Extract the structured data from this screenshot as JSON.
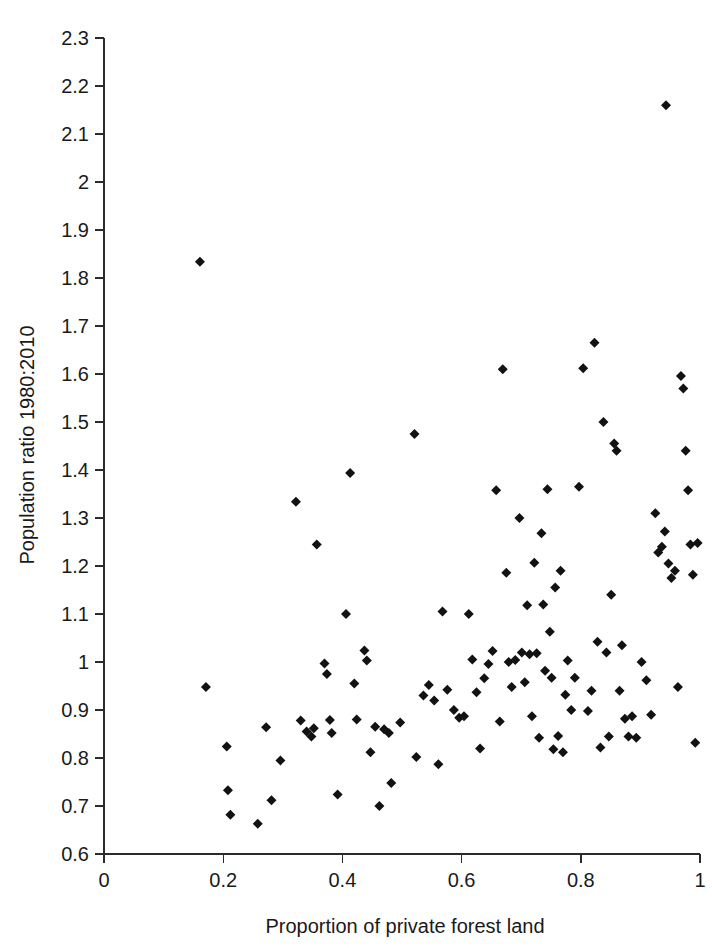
{
  "figure": {
    "background_color": "#ffffff",
    "marker_color": "#121212",
    "axis_color": "#2b2b2b",
    "marker_shape": "diamond"
  },
  "chart_data": {
    "type": "scatter",
    "title": "",
    "subtitle": "",
    "xlabel": "Proportion of private forest land",
    "ylabel": "Population ratio 1980:2010",
    "xlim": [
      0,
      1
    ],
    "ylim": [
      0.6,
      2.3
    ],
    "grid": false,
    "legend": null,
    "xticks": [
      0,
      0.2,
      0.4,
      0.6,
      0.8,
      1
    ],
    "xtick_labels": [
      "0",
      "0.2",
      "0.4",
      "0.6",
      "0.8",
      "1"
    ],
    "yticks": [
      0.6,
      0.7,
      0.8,
      0.9,
      1.0,
      1.1,
      1.2,
      1.3,
      1.4,
      1.5,
      1.6,
      1.7,
      1.8,
      1.9,
      2.0,
      2.1,
      2.2,
      2.3
    ],
    "ytick_labels": [
      "0.6",
      "0.7",
      "0.8",
      "0.9",
      "1",
      "1.1",
      "1.2",
      "1.3",
      "1.4",
      "1.5",
      "1.6",
      "1.7",
      "1.8",
      "1.9",
      "2",
      "2.1",
      "2.2",
      "2.3"
    ],
    "n_points": 121,
    "points": [
      [
        0.161,
        1.834
      ],
      [
        0.943,
        2.16
      ],
      [
        0.171,
        0.948
      ],
      [
        0.206,
        0.824
      ],
      [
        0.208,
        0.733
      ],
      [
        0.212,
        0.682
      ],
      [
        0.258,
        0.663
      ],
      [
        0.272,
        0.864
      ],
      [
        0.281,
        0.712
      ],
      [
        0.296,
        0.795
      ],
      [
        0.322,
        1.334
      ],
      [
        0.33,
        0.878
      ],
      [
        0.34,
        0.855
      ],
      [
        0.348,
        0.845
      ],
      [
        0.352,
        0.862
      ],
      [
        0.357,
        1.245
      ],
      [
        0.37,
        0.997
      ],
      [
        0.374,
        0.975
      ],
      [
        0.379,
        0.879
      ],
      [
        0.382,
        0.852
      ],
      [
        0.392,
        0.724
      ],
      [
        0.406,
        1.1
      ],
      [
        0.413,
        1.394
      ],
      [
        0.42,
        0.955
      ],
      [
        0.424,
        0.88
      ],
      [
        0.437,
        1.024
      ],
      [
        0.441,
        1.003
      ],
      [
        0.447,
        0.812
      ],
      [
        0.455,
        0.865
      ],
      [
        0.462,
        0.7
      ],
      [
        0.47,
        0.86
      ],
      [
        0.478,
        0.852
      ],
      [
        0.482,
        0.748
      ],
      [
        0.497,
        0.874
      ],
      [
        0.521,
        1.475
      ],
      [
        0.524,
        0.802
      ],
      [
        0.536,
        0.93
      ],
      [
        0.545,
        0.952
      ],
      [
        0.554,
        0.92
      ],
      [
        0.561,
        0.787
      ],
      [
        0.568,
        1.105
      ],
      [
        0.576,
        0.942
      ],
      [
        0.587,
        0.9
      ],
      [
        0.596,
        0.884
      ],
      [
        0.604,
        0.887
      ],
      [
        0.612,
        1.1
      ],
      [
        0.618,
        1.005
      ],
      [
        0.625,
        0.937
      ],
      [
        0.631,
        0.82
      ],
      [
        0.638,
        0.966
      ],
      [
        0.645,
        0.996
      ],
      [
        0.652,
        1.023
      ],
      [
        0.658,
        1.358
      ],
      [
        0.664,
        0.876
      ],
      [
        0.669,
        1.61
      ],
      [
        0.675,
        1.186
      ],
      [
        0.679,
        1.0
      ],
      [
        0.684,
        0.948
      ],
      [
        0.69,
        1.004
      ],
      [
        0.697,
        1.3
      ],
      [
        0.701,
        1.02
      ],
      [
        0.706,
        0.958
      ],
      [
        0.71,
        1.118
      ],
      [
        0.714,
        1.016
      ],
      [
        0.718,
        0.887
      ],
      [
        0.722,
        1.207
      ],
      [
        0.726,
        1.018
      ],
      [
        0.73,
        0.842
      ],
      [
        0.734,
        1.268
      ],
      [
        0.737,
        1.12
      ],
      [
        0.74,
        0.982
      ],
      [
        0.744,
        1.36
      ],
      [
        0.748,
        1.063
      ],
      [
        0.751,
        0.967
      ],
      [
        0.754,
        0.818
      ],
      [
        0.757,
        1.155
      ],
      [
        0.762,
        0.846
      ],
      [
        0.766,
        1.19
      ],
      [
        0.77,
        0.812
      ],
      [
        0.774,
        0.932
      ],
      [
        0.778,
        1.003
      ],
      [
        0.784,
        0.9
      ],
      [
        0.79,
        0.967
      ],
      [
        0.797,
        1.365
      ],
      [
        0.804,
        1.612
      ],
      [
        0.812,
        0.898
      ],
      [
        0.818,
        0.94
      ],
      [
        0.823,
        1.665
      ],
      [
        0.828,
        1.042
      ],
      [
        0.833,
        0.822
      ],
      [
        0.838,
        1.5
      ],
      [
        0.843,
        1.02
      ],
      [
        0.847,
        0.845
      ],
      [
        0.851,
        1.14
      ],
      [
        0.856,
        1.455
      ],
      [
        0.86,
        1.44
      ],
      [
        0.865,
        0.94
      ],
      [
        0.869,
        1.035
      ],
      [
        0.874,
        0.882
      ],
      [
        0.88,
        0.845
      ],
      [
        0.886,
        0.887
      ],
      [
        0.893,
        0.842
      ],
      [
        0.902,
        1.0
      ],
      [
        0.91,
        0.962
      ],
      [
        0.918,
        0.89
      ],
      [
        0.925,
        1.31
      ],
      [
        0.93,
        1.228
      ],
      [
        0.936,
        1.24
      ],
      [
        0.941,
        1.272
      ],
      [
        0.947,
        1.205
      ],
      [
        0.952,
        1.175
      ],
      [
        0.958,
        1.19
      ],
      [
        0.963,
        0.948
      ],
      [
        0.968,
        1.596
      ],
      [
        0.972,
        1.57
      ],
      [
        0.976,
        1.44
      ],
      [
        0.98,
        1.358
      ],
      [
        0.984,
        1.245
      ],
      [
        0.988,
        1.182
      ],
      [
        0.992,
        0.832
      ],
      [
        0.996,
        1.248
      ]
    ]
  }
}
